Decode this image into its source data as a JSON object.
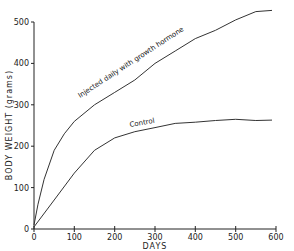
{
  "chart_data": {
    "type": "line",
    "title": "",
    "xlabel": "DAYS",
    "ylabel": "BODY WEIGHT (grams)",
    "xlim": [
      0,
      600
    ],
    "ylim": [
      0,
      500
    ],
    "xticks": [
      0,
      100,
      200,
      300,
      400,
      500,
      600
    ],
    "yticks": [
      0,
      100,
      200,
      300,
      400,
      500
    ],
    "grid": false,
    "legend": null,
    "series": [
      {
        "name": "Injected daily with growth hormone",
        "x": [
          0,
          10,
          25,
          50,
          75,
          100,
          150,
          200,
          250,
          300,
          350,
          400,
          450,
          500,
          550,
          590
        ],
        "values": [
          10,
          60,
          120,
          190,
          230,
          260,
          300,
          330,
          360,
          400,
          430,
          460,
          480,
          505,
          525,
          528
        ]
      },
      {
        "name": "Control",
        "x": [
          0,
          50,
          100,
          150,
          200,
          250,
          300,
          350,
          400,
          450,
          500,
          550,
          590
        ],
        "values": [
          5,
          70,
          135,
          190,
          220,
          235,
          245,
          255,
          258,
          262,
          265,
          262,
          263
        ]
      }
    ],
    "annotations": [
      {
        "text": "Injected daily with growth hormone",
        "series": 0
      },
      {
        "text": "Control",
        "series": 1
      }
    ]
  },
  "labels": {
    "xlabel": "DAYS",
    "ylabel": "BODY WEIGHT (grams)",
    "annot_gh": "Injected daily with growth hormone",
    "annot_control": "Control",
    "x0": "0",
    "x1": "100",
    "x2": "200",
    "x3": "300",
    "x4": "400",
    "x5": "500",
    "x6": "600",
    "y0": "0",
    "y1": "100",
    "y2": "200",
    "y3": "300",
    "y4": "400",
    "y5": "500"
  }
}
